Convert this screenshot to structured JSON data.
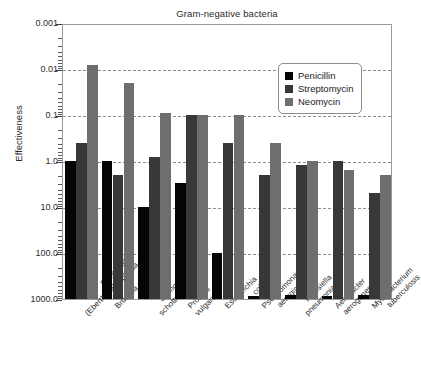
{
  "chart_data": {
    "type": "bar",
    "title": "Gram-negative bacteria",
    "xlabel": "",
    "ylabel": "Effectiveness",
    "yscale": "log",
    "y_inverted": true,
    "ylim": [
      0.001,
      1000.0
    ],
    "ytick_labels": [
      "0.001",
      "0.01",
      "0.1",
      "1.0",
      "10.0",
      "100.0",
      "1000.0"
    ],
    "ytick_values": [
      0.001,
      0.01,
      0.1,
      1.0,
      10.0,
      100.0,
      1000.0
    ],
    "grid": true,
    "legend_position": "upper right",
    "categories": [
      "Salmonella (Eberthella) typhosa",
      "Brucella abortus",
      "Salmonella schottmuelleri",
      "Proteus vulgaris",
      "Escherichia coli",
      "Pseudomonas aeruginosa",
      "Klebsiella pneumoniae",
      "Aerobacter aerogenes",
      "Mycobacterium tuberculosis"
    ],
    "category_lines": [
      [
        "Salmonella",
        "(Eberthella) typhosa"
      ],
      [
        "Brucella abortus",
        ""
      ],
      [
        "Salmonella",
        "schottmuelleri"
      ],
      [
        "Proteus",
        "vulgaris"
      ],
      [
        "Escherichia",
        "coli"
      ],
      [
        "Pseudomonas",
        "aeruginosa"
      ],
      [
        "Klebsiella",
        "pneumoniae"
      ],
      [
        "Aerobacter",
        "aerogenes"
      ],
      [
        "Mycobacterium",
        "tuberculosis"
      ]
    ],
    "series": [
      {
        "name": "Penicillin",
        "color": "#050505",
        "values": [
          1.0,
          1.0,
          10.0,
          3.0,
          100.0,
          850.0,
          820.0,
          870.0,
          800.0
        ]
      },
      {
        "name": "Streptomycin",
        "color": "#383838",
        "values": [
          0.4,
          2.0,
          0.8,
          0.1,
          0.4,
          2.0,
          1.2,
          1.0,
          5.0
        ]
      },
      {
        "name": "Neomycin",
        "color": "#6e6e6e",
        "values": [
          0.008,
          0.02,
          0.09,
          0.1,
          0.1,
          0.4,
          1.0,
          1.6,
          2.0
        ]
      }
    ]
  },
  "legend": {
    "items": [
      {
        "label": "Penicillin",
        "color": "#050505"
      },
      {
        "label": "Streptomycin",
        "color": "#383838"
      },
      {
        "label": "Neomycin",
        "color": "#6e6e6e"
      }
    ]
  }
}
